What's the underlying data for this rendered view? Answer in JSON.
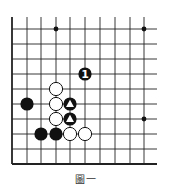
{
  "caption": "圖一",
  "board": {
    "x_lines": [
      12,
      27,
      41,
      56,
      70,
      85,
      100,
      115,
      130,
      144
    ],
    "y_lines": [
      29,
      44,
      59,
      74,
      89,
      104,
      119,
      134,
      149,
      164
    ],
    "top_extent": 17,
    "right_extent": 157,
    "edges": [
      "left",
      "bottom"
    ],
    "line_color": "#222222",
    "star_points": [
      [
        3,
        0
      ],
      [
        9,
        0
      ],
      [
        9,
        6
      ]
    ],
    "stones": [
      {
        "col": 5,
        "row": 3,
        "color": "black",
        "label": "1"
      },
      {
        "col": 3,
        "row": 4,
        "color": "white"
      },
      {
        "col": 3,
        "row": 5,
        "color": "white"
      },
      {
        "col": 3,
        "row": 6,
        "color": "white"
      },
      {
        "col": 4,
        "row": 7,
        "color": "white"
      },
      {
        "col": 5,
        "row": 7,
        "color": "white"
      },
      {
        "col": 4,
        "row": 5,
        "color": "black",
        "mark": "triangle"
      },
      {
        "col": 4,
        "row": 6,
        "color": "black",
        "mark": "triangle"
      },
      {
        "col": 1,
        "row": 5,
        "color": "black"
      },
      {
        "col": 2,
        "row": 7,
        "color": "black"
      },
      {
        "col": 3,
        "row": 7,
        "color": "black"
      }
    ]
  }
}
